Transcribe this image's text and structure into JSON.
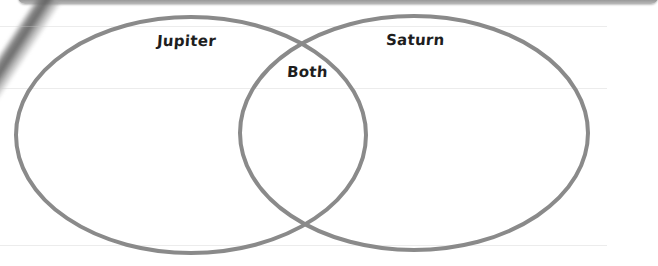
{
  "diagram": {
    "type": "venn",
    "sets": [
      {
        "id": "left",
        "label": "Jupiter",
        "cx": 191,
        "cy": 135,
        "rx": 175,
        "ry": 118
      },
      {
        "id": "right",
        "label": "Saturn",
        "cx": 414,
        "cy": 133,
        "rx": 174,
        "ry": 117
      }
    ],
    "intersection_label": "Both",
    "stroke_color": "#8a8a8a",
    "stroke_width": 4,
    "label_color": "#1e1e1e",
    "background": "#ffffff"
  }
}
